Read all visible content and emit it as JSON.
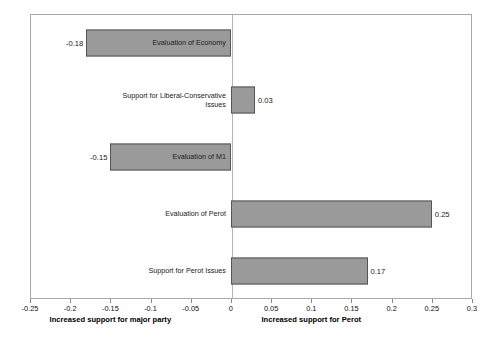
{
  "chart_data": {
    "type": "bar",
    "orientation": "horizontal",
    "title": "",
    "xlabel": "",
    "ylabel": "",
    "xlim": [
      -0.25,
      0.3
    ],
    "grid": false,
    "legend": null,
    "xticks": [
      -0.25,
      -0.2,
      -0.15,
      -0.1,
      -0.05,
      0,
      0.05,
      0.1,
      0.15,
      0.2,
      0.25,
      0.3
    ],
    "xticklabels": [
      "-0.25",
      "-0.2",
      "-0.15",
      "-0.1",
      "-0.05",
      "0",
      "0.05",
      "0.1",
      "0.15",
      "0.2",
      "0.25",
      "0.3"
    ],
    "categories": [
      "Evaluation of Economy",
      "Support for Liberal-Conservative\nIssues",
      "Evaluation of M1",
      "Evaluation of Perot",
      "Support for Perot Issues"
    ],
    "values": [
      -0.18,
      0.03,
      -0.15,
      0.25,
      0.17
    ],
    "value_labels": [
      "-0.18",
      "0.03",
      "-0.15",
      "0.25",
      "0.17"
    ],
    "axis_captions": [
      {
        "text": "Increased support for major party",
        "at": -0.15
      },
      {
        "text": "Increased support for Perot",
        "at": 0.1
      }
    ],
    "colors": {
      "bar_fill": "#9a9a9a",
      "bar_stroke": "#555555",
      "frame": "#a8a8a8",
      "zero_line": "#b5b5b5",
      "text": "#111111"
    }
  }
}
